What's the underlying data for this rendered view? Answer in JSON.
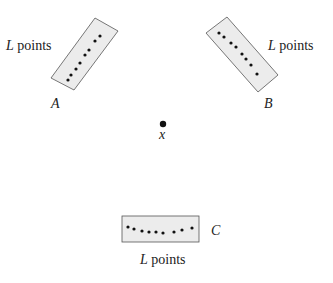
{
  "diagram": {
    "groups": [
      {
        "id": "A",
        "label": "A",
        "points_label_var": "L",
        "points_label_text": " points"
      },
      {
        "id": "B",
        "label": "B",
        "points_label_var": "L",
        "points_label_text": " points"
      },
      {
        "id": "C",
        "label": "C",
        "points_label_var": "L",
        "points_label_text": " points"
      }
    ],
    "center": {
      "label": "x"
    },
    "colors": {
      "box_fill": "#ececec",
      "box_stroke": "#555555",
      "dot": "#111111"
    }
  }
}
